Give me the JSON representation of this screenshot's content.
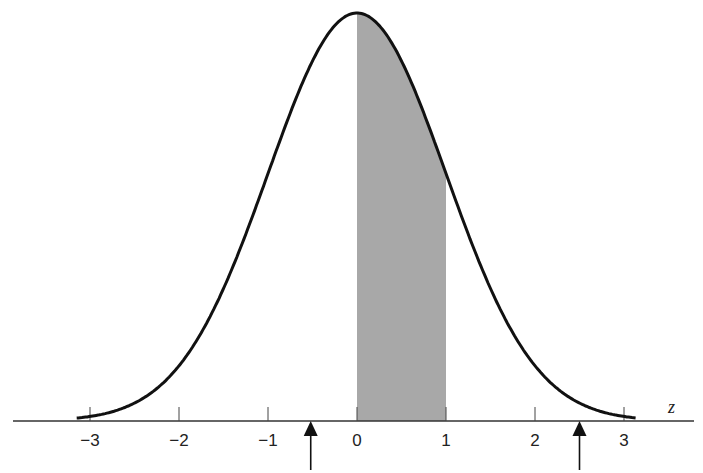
{
  "chart_data": {
    "type": "area",
    "title": "",
    "xlabel": "z",
    "ylabel": "",
    "xlim": [
      -3.2,
      3.6
    ],
    "x_ticks": [
      -3,
      -2,
      -1,
      0,
      1,
      2,
      3
    ],
    "x_tick_labels": [
      "−3",
      "−2",
      "−1",
      "0",
      "1",
      "2",
      "3"
    ],
    "curve": "standard normal pdf",
    "shaded_region": {
      "from": 0,
      "to": 1,
      "color": "#a8a8a8"
    },
    "arrows": [
      {
        "z": -0.52,
        "direction": "up"
      },
      {
        "z": 2.5,
        "direction": "up"
      }
    ],
    "grid": false,
    "legend": null
  },
  "labels": {
    "axis_variable": "z",
    "ticks": [
      "−3",
      "−2",
      "−1",
      "0",
      "1",
      "2",
      "3"
    ]
  },
  "colors": {
    "curve": "#111111",
    "shade": "#a8a8a8",
    "axis": "#333333"
  }
}
